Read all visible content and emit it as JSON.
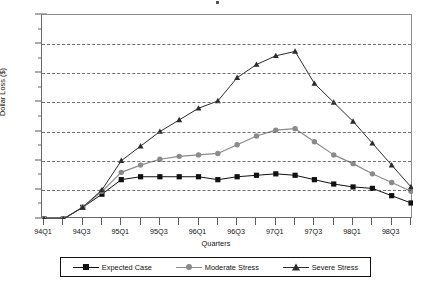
{
  "chart_data": {
    "type": "line",
    "title": "",
    "xlabel": "Quarters",
    "ylabel": "Dollar Loss ($)",
    "ylim": [
      0,
      140
    ],
    "ytick_step": 20,
    "yminor_step": 10,
    "grid": "horizontal-dashed",
    "legend_position": "bottom",
    "x": [
      "94Q1",
      "94Q2",
      "94Q3",
      "94Q4",
      "95Q1",
      "95Q2",
      "95Q3",
      "95Q4",
      "96Q1",
      "96Q2",
      "96Q3",
      "96Q4",
      "97Q1",
      "97Q2",
      "97Q3",
      "97Q4",
      "98Q1",
      "98Q2",
      "98Q3",
      "98Q4"
    ],
    "xtick_labels": [
      "94Q1",
      "",
      "94Q3",
      "",
      "95Q1",
      "",
      "95Q3",
      "",
      "96Q1",
      "",
      "96Q3",
      "",
      "97Q1",
      "",
      "97Q3",
      "",
      "98Q1",
      "",
      "98Q3",
      ""
    ],
    "series": [
      {
        "name": "Expected Case",
        "marker": "square",
        "color": "#111111",
        "values": [
          0,
          0,
          8,
          17,
          27,
          29,
          29,
          29,
          29,
          27,
          29,
          30,
          31,
          30,
          27,
          24,
          22,
          21,
          16,
          11
        ]
      },
      {
        "name": "Moderate Stress",
        "marker": "circle",
        "color": "#8a8a8a",
        "values": [
          0,
          0,
          8,
          19,
          32,
          37,
          41,
          43,
          44,
          45,
          51,
          57,
          61,
          62,
          53,
          44,
          38,
          31,
          25,
          19
        ]
      },
      {
        "name": "Severe Stress",
        "marker": "triangle",
        "color": "#2b2b2b",
        "values": [
          0,
          0,
          8,
          20,
          40,
          50,
          60,
          68,
          76,
          81,
          97,
          106,
          112,
          115,
          93,
          80,
          67,
          52,
          37,
          22
        ]
      }
    ]
  },
  "axes": {
    "y_ticks": [
      0,
      20,
      40,
      60,
      80,
      100,
      120,
      140
    ],
    "y_minor_ticks": [
      10,
      30,
      50,
      70,
      90,
      110,
      130
    ]
  },
  "legend": {
    "items": [
      {
        "label": "Expected Case"
      },
      {
        "label": "Moderate Stress"
      },
      {
        "label": "Severe Stress"
      }
    ]
  }
}
